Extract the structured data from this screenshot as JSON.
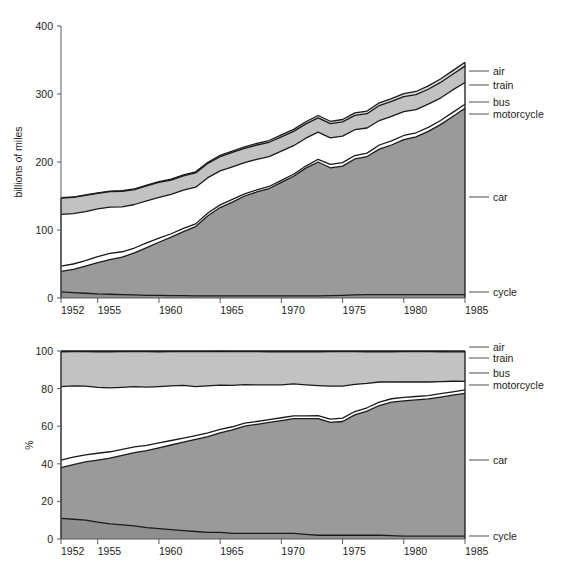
{
  "figure": {
    "width": 568,
    "height": 568,
    "background": "#ffffff"
  },
  "colors": {
    "air": "#d8d8d8",
    "train": "#c2c2c2",
    "bus": "#ffffff",
    "motorcycle": "#ffffff",
    "car": "#9a9a9a",
    "cycle": "#8f8f8f",
    "outline": "#1a1a1a",
    "axis": "#5a5a5a",
    "text": "#1c1c1c"
  },
  "series_labels": {
    "air": "air",
    "train": "train",
    "bus": "bus",
    "motorcycle": "motorcycle",
    "car": "car",
    "cycle": "cycle"
  },
  "chart_data": [
    {
      "id": "absolute",
      "type": "area",
      "stacked": true,
      "title": "",
      "xlabel": "",
      "ylabel": "billions of miles",
      "xlim": [
        1952,
        1985
      ],
      "ylim": [
        0,
        400
      ],
      "grid": false,
      "legend_position": "right-inline",
      "xticks": [
        1952,
        1955,
        1960,
        1965,
        1970,
        1975,
        1980,
        1985
      ],
      "yticks": [
        0,
        100,
        200,
        300,
        400
      ],
      "x": [
        1952,
        1953,
        1954,
        1955,
        1956,
        1957,
        1958,
        1959,
        1960,
        1961,
        1962,
        1963,
        1964,
        1965,
        1966,
        1967,
        1968,
        1969,
        1970,
        1971,
        1972,
        1973,
        1974,
        1975,
        1976,
        1977,
        1978,
        1979,
        1980,
        1981,
        1982,
        1983,
        1984,
        1985
      ],
      "series": [
        {
          "name": "cycle",
          "values": [
            9,
            8,
            7,
            6,
            5.5,
            5,
            4.5,
            4,
            4,
            3.5,
            3.5,
            3,
            3,
            3,
            3,
            3,
            3,
            3,
            3,
            3,
            3,
            3,
            3.5,
            4,
            4.5,
            5,
            5,
            5,
            5,
            5,
            5,
            5,
            5,
            5
          ]
        },
        {
          "name": "car",
          "values": [
            30,
            34,
            40,
            46,
            51,
            55,
            62,
            70,
            78,
            86,
            94,
            102,
            118,
            130,
            138,
            147,
            153,
            158,
            167,
            176,
            188,
            197,
            188,
            190,
            200,
            203,
            214,
            220,
            228,
            232,
            240,
            250,
            262,
            274
          ]
        },
        {
          "name": "motorcycle",
          "values": [
            8,
            8,
            8,
            9,
            9,
            8,
            7,
            7,
            6,
            5,
            5,
            4,
            4,
            4,
            4,
            3,
            3,
            3,
            3,
            3,
            3,
            4,
            5,
            5,
            5,
            5,
            6,
            6,
            6,
            6,
            6,
            6,
            6,
            6
          ]
        },
        {
          "name": "bus",
          "values": [
            76,
            74,
            72,
            70,
            68,
            66,
            64,
            62,
            60,
            58,
            56,
            54,
            52,
            50,
            48,
            46,
            45,
            44,
            43,
            42,
            41,
            40,
            39,
            39,
            38,
            37,
            36,
            36,
            35,
            34,
            34,
            33,
            33,
            32
          ]
        },
        {
          "name": "train",
          "values": [
            24,
            24,
            24,
            23,
            23,
            23,
            22,
            22,
            22,
            21,
            21,
            21,
            21,
            21,
            21,
            21,
            21,
            21,
            21,
            21,
            21,
            21,
            21,
            21,
            21,
            21,
            22,
            22,
            22,
            22,
            22,
            23,
            23,
            24
          ]
        },
        {
          "name": "air",
          "values": [
            0.5,
            0.5,
            0.6,
            0.7,
            0.8,
            0.9,
            1,
            1.1,
            1.2,
            1.3,
            1.4,
            1.5,
            1.7,
            1.9,
            2,
            2.2,
            2.4,
            2.6,
            2.8,
            3,
            3.2,
            3.4,
            3.4,
            3.5,
            3.7,
            3.9,
            4.1,
            4.3,
            4.5,
            4.7,
            4.9,
            5.1,
            5.4,
            5.6
          ]
        }
      ],
      "totals_note": "top of stack rises from about 121 in 1952 to about 335 in 1985"
    },
    {
      "id": "percentage",
      "type": "area",
      "stacked": true,
      "normalized": true,
      "title": "",
      "xlabel": "",
      "ylabel": "%",
      "xlim": [
        1952,
        1985
      ],
      "ylim": [
        0,
        100
      ],
      "grid": false,
      "legend_position": "right-inline",
      "xticks": [
        1952,
        1955,
        1960,
        1965,
        1970,
        1975,
        1980,
        1985
      ],
      "yticks": [
        0,
        20,
        40,
        60,
        80,
        100
      ],
      "x": [
        1952,
        1953,
        1954,
        1955,
        1956,
        1957,
        1958,
        1959,
        1960,
        1961,
        1962,
        1963,
        1964,
        1965,
        1966,
        1967,
        1968,
        1969,
        1970,
        1971,
        1972,
        1973,
        1974,
        1975,
        1976,
        1977,
        1978,
        1979,
        1980,
        1981,
        1982,
        1983,
        1984,
        1985
      ],
      "series": [
        {
          "name": "cycle",
          "values": [
            11,
            10.5,
            10,
            9,
            8,
            7.5,
            7,
            6,
            5.5,
            5,
            4.5,
            4,
            3.5,
            3.5,
            3,
            3,
            3,
            3,
            3,
            3,
            2.5,
            2,
            2,
            2,
            2,
            2,
            2,
            1.8,
            1.5,
            1.5,
            1.5,
            1.5,
            1.5,
            1.5
          ]
        },
        {
          "name": "car",
          "values": [
            27,
            29,
            31,
            33,
            35,
            37,
            39,
            41,
            43,
            45,
            47,
            49,
            51,
            53,
            55,
            57,
            58,
            59,
            60,
            61,
            61.5,
            62,
            60,
            60.5,
            64,
            66,
            69,
            71,
            72,
            72.5,
            73,
            74,
            75,
            76
          ]
        },
        {
          "name": "motorcycle",
          "values": [
            4,
            4,
            3.8,
            3.6,
            3.4,
            3.2,
            3,
            2.8,
            2.6,
            2.4,
            2.2,
            2,
            1.9,
            1.8,
            1.7,
            1.6,
            1.5,
            1.5,
            1.5,
            1.5,
            1.5,
            1.6,
            1.8,
            1.8,
            1.8,
            1.8,
            1.8,
            1.8,
            1.8,
            1.8,
            1.8,
            1.8,
            1.8,
            1.8
          ]
        },
        {
          "name": "bus",
          "values": [
            39,
            38,
            36.5,
            35,
            34,
            33,
            32,
            31,
            30,
            29,
            28,
            26,
            25,
            23.5,
            22,
            20.5,
            19.5,
            18.5,
            17.5,
            17,
            16.5,
            16,
            17.5,
            17,
            14.5,
            13,
            10.7,
            9,
            8.2,
            7.7,
            7.2,
            6.4,
            5.6,
            4.5
          ]
        },
        {
          "name": "train",
          "values": [
            18.6,
            18.2,
            18.4,
            19,
            19.2,
            19,
            18.7,
            18.9,
            18.5,
            18.3,
            18,
            18.7,
            18.3,
            18,
            18,
            17.6,
            17.7,
            17.6,
            17.7,
            17.1,
            17.7,
            18,
            18.4,
            18.4,
            17.4,
            16.8,
            16.1,
            16,
            16.2,
            16.2,
            16.2,
            15.9,
            15.6,
            15.7
          ]
        },
        {
          "name": "air",
          "values": [
            0.4,
            0.3,
            0.3,
            0.4,
            0.4,
            0.3,
            0.3,
            0.3,
            0.4,
            0.3,
            0.3,
            0.3,
            0.3,
            0.2,
            0.3,
            0.3,
            0.3,
            0.4,
            0.3,
            0.4,
            0.3,
            0.4,
            0.3,
            0.3,
            0.3,
            0.4,
            0.4,
            0.4,
            0.3,
            0.3,
            0.3,
            0.4,
            0.5,
            0.5
          ]
        }
      ]
    }
  ]
}
